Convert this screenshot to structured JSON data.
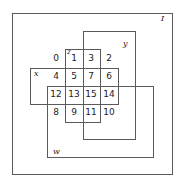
{
  "diagram": {
    "type": "karnaugh-venn",
    "universe_label": "I",
    "sets": {
      "y": "y",
      "z": "z",
      "x": "x",
      "w": "w"
    },
    "cells": [
      {
        "id": 0,
        "label": "0",
        "row": 0,
        "col": 0
      },
      {
        "id": 1,
        "label": "1",
        "row": 0,
        "col": 1
      },
      {
        "id": 3,
        "label": "3",
        "row": 0,
        "col": 2
      },
      {
        "id": 2,
        "label": "2",
        "row": 0,
        "col": 3
      },
      {
        "id": 4,
        "label": "4",
        "row": 1,
        "col": 0
      },
      {
        "id": 5,
        "label": "5",
        "row": 1,
        "col": 1
      },
      {
        "id": 7,
        "label": "7",
        "row": 1,
        "col": 2
      },
      {
        "id": 6,
        "label": "6",
        "row": 1,
        "col": 3
      },
      {
        "id": 12,
        "label": "12",
        "row": 2,
        "col": 0
      },
      {
        "id": 13,
        "label": "13",
        "row": 2,
        "col": 1
      },
      {
        "id": 15,
        "label": "15",
        "row": 2,
        "col": 2
      },
      {
        "id": 14,
        "label": "14",
        "row": 2,
        "col": 3
      },
      {
        "id": 8,
        "label": "8",
        "row": 3,
        "col": 0
      },
      {
        "id": 9,
        "label": "9",
        "row": 3,
        "col": 1
      },
      {
        "id": 11,
        "label": "11",
        "row": 3,
        "col": 2
      },
      {
        "id": 10,
        "label": "10",
        "row": 3,
        "col": 3
      }
    ]
  }
}
